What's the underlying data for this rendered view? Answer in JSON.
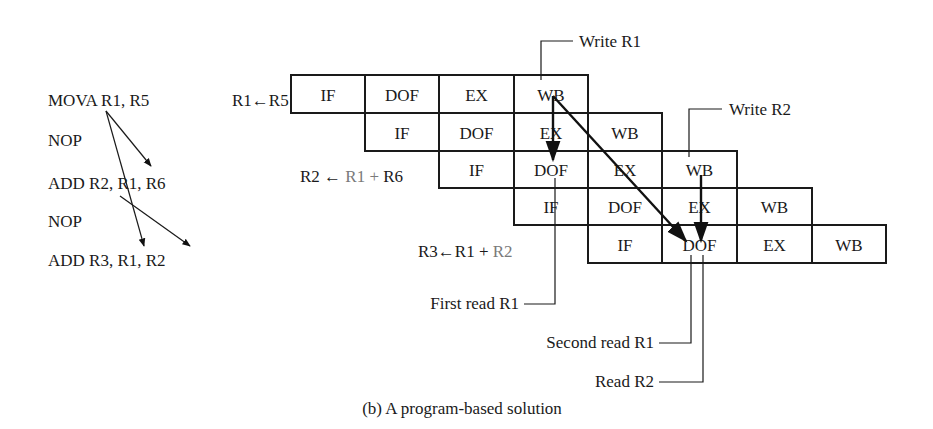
{
  "program": {
    "lines": [
      {
        "text": "MOVA R1, R5",
        "x": 48,
        "y": 106
      },
      {
        "text": "NOP",
        "x": 48,
        "y": 146
      },
      {
        "text": "ADD R2, R1, R6",
        "x": 48,
        "y": 189
      },
      {
        "text": "NOP",
        "x": 48,
        "y": 227
      },
      {
        "text": "ADD R3, R1, R2",
        "x": 48,
        "y": 266
      }
    ],
    "dependency_arrows": [
      {
        "from": "MOVA R1",
        "to": "ADD R2 operand R1",
        "x1": 106,
        "y1": 111,
        "x2": 151,
        "y2": 166
      },
      {
        "from": "MOVA R1",
        "to": "ADD R3 operand R1",
        "x1": 106,
        "y1": 111,
        "x2": 144,
        "y2": 246
      },
      {
        "from": "ADD R2 dest",
        "to": "ADD R3 operand R2",
        "x1": 120,
        "y1": 196,
        "x2": 190,
        "y2": 246
      }
    ]
  },
  "equations": [
    {
      "name": "eq-r1",
      "parts": [
        {
          "text": "R1",
          "gray": false
        },
        {
          "text": "←",
          "gray": false
        },
        {
          "text": "R5",
          "gray": false
        }
      ],
      "x": 232,
      "y": 106
    },
    {
      "name": "eq-r2",
      "parts": [
        {
          "text": "R2 ← ",
          "gray": false
        },
        {
          "text": "R1 +",
          "gray": true
        },
        {
          "text": " R6",
          "gray": false
        }
      ],
      "x": 300,
      "y": 182
    },
    {
      "name": "eq-r3",
      "parts": [
        {
          "text": "R3←R1 +",
          "gray": false
        },
        {
          "text": " R2",
          "gray": true
        }
      ],
      "x": 418,
      "y": 257
    }
  ],
  "pipeline": {
    "col_x": [
      291,
      365,
      439,
      514,
      588,
      662,
      737,
      812,
      886
    ],
    "row_y": [
      75,
      113,
      151,
      188,
      225,
      263
    ],
    "rows": [
      {
        "start_col": 0,
        "stages": [
          "IF",
          "DOF",
          "EX",
          "WB"
        ]
      },
      {
        "start_col": 1,
        "stages": [
          "IF",
          "DOF",
          "EX",
          "WB"
        ]
      },
      {
        "start_col": 2,
        "stages": [
          "IF",
          "DOF",
          "EX",
          "WB"
        ]
      },
      {
        "start_col": 3,
        "stages": [
          "IF",
          "DOF",
          "EX",
          "WB"
        ]
      },
      {
        "start_col": 4,
        "stages": [
          "IF",
          "DOF",
          "EX",
          "WB"
        ]
      }
    ],
    "forward_arrows": [
      {
        "label": "WB row1 to DOF row3",
        "x1": 553,
        "y1": 96,
        "x2": 553,
        "y2": 160
      },
      {
        "label": "WB row1 to DOF row5",
        "x1": 553,
        "y1": 96,
        "x2": 686,
        "y2": 241
      },
      {
        "label": "WB row3 to DOF row5",
        "x1": 701,
        "y1": 175,
        "x2": 701,
        "y2": 241
      }
    ]
  },
  "callouts": [
    {
      "name": "write-r1",
      "text": "Write R1",
      "points": "541,80 541,41 573,41",
      "tx": 579,
      "ty": 47,
      "anchor": "start"
    },
    {
      "name": "write-r2",
      "text": "Write R2",
      "points": "689,157 689,109 722,109",
      "tx": 729,
      "ty": 115,
      "anchor": "start"
    },
    {
      "name": "first-read-r1",
      "text": "First read R1",
      "points": "555,178 555,304 524,304",
      "tx": 519,
      "ty": 309,
      "anchor": "end"
    },
    {
      "name": "second-read-r1",
      "text": "Second read R1",
      "points": "691,255 691,343 659,343",
      "tx": 654,
      "ty": 348,
      "anchor": "end"
    },
    {
      "name": "read-r2",
      "text": "Read R2",
      "points": "703,255 703,382 659,382",
      "tx": 654,
      "ty": 387,
      "anchor": "end"
    }
  ],
  "caption": {
    "text": "(b) A program-based solution",
    "x": 462,
    "y": 414
  }
}
